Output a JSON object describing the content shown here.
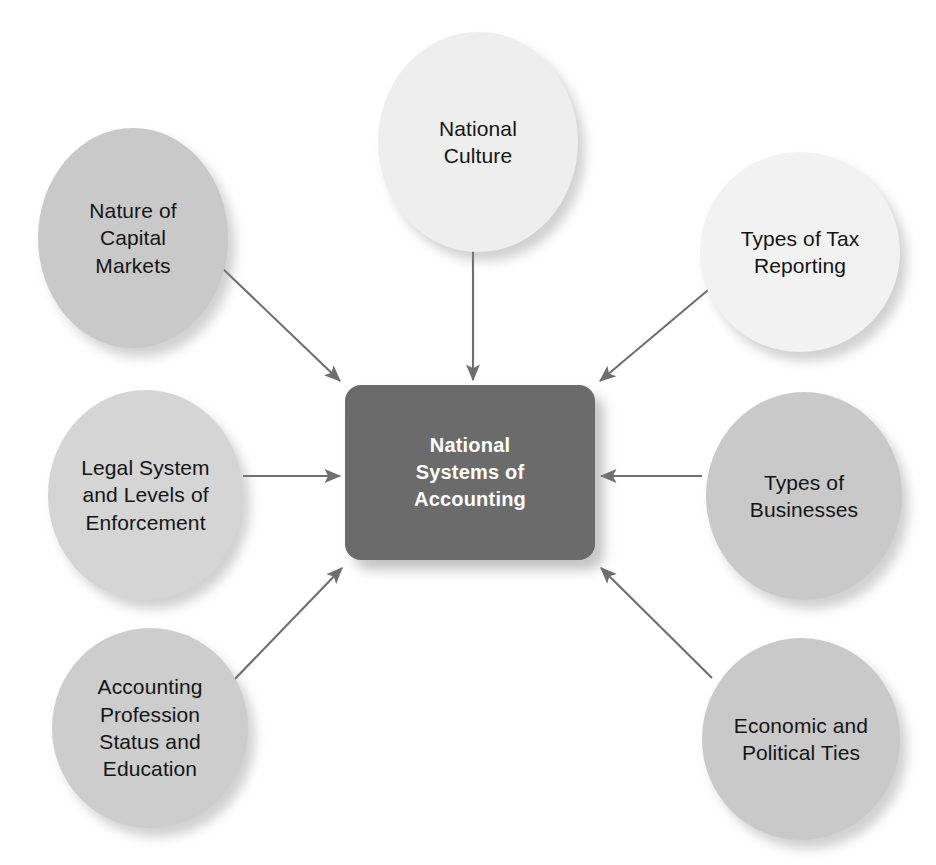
{
  "diagram": {
    "type": "hub-and-spoke",
    "title": "National Systems of Accounting",
    "background_color": "#ffffff",
    "arrow_color": "#6e6e6e",
    "center": {
      "label": "National\nSystems of\nAccounting",
      "fill_color": "#6b6b6b",
      "text_color": "#ffffff",
      "x": 345,
      "y": 385,
      "width": 250,
      "height": 175
    },
    "nodes": [
      {
        "id": "nature-of-capital-markets",
        "label": "Nature of\nCapital\nMarkets",
        "fill_color": "#c9c9c9",
        "text_color": "#141414",
        "x": 38,
        "y": 128,
        "width": 190,
        "height": 220,
        "arrow": "diagonal-down-right"
      },
      {
        "id": "national-culture",
        "label": "National\nCulture",
        "fill_color": "#eeeeee",
        "text_color": "#141414",
        "x": 378,
        "y": 32,
        "width": 200,
        "height": 220,
        "arrow": "straight-down"
      },
      {
        "id": "types-of-tax-reporting",
        "label": "Types of Tax\nReporting",
        "fill_color": "#f2f2f2",
        "text_color": "#141414",
        "x": 700,
        "y": 152,
        "width": 200,
        "height": 200,
        "arrow": "diagonal-down-left"
      },
      {
        "id": "legal-system-and-levels-of-enforcement",
        "label": "Legal System\nand Levels of\nEnforcement",
        "fill_color": "#d5d5d5",
        "text_color": "#141414",
        "x": 48,
        "y": 390,
        "width": 195,
        "height": 210,
        "arrow": "straight-right"
      },
      {
        "id": "types-of-businesses",
        "label": "Types of\nBusinesses",
        "fill_color": "#c9c9c9",
        "text_color": "#141414",
        "x": 706,
        "y": 392,
        "width": 196,
        "height": 208,
        "arrow": "straight-left"
      },
      {
        "id": "accounting-profession-status-and-education",
        "label": "Accounting\nProfession\nStatus and\nEducation",
        "fill_color": "#cdcdcd",
        "text_color": "#141414",
        "x": 52,
        "y": 628,
        "width": 196,
        "height": 200,
        "arrow": "diagonal-up-right"
      },
      {
        "id": "economic-and-political-ties",
        "label": "Economic and\nPolitical Ties",
        "fill_color": "#c9c9c9",
        "text_color": "#141414",
        "x": 702,
        "y": 638,
        "width": 198,
        "height": 202,
        "arrow": "diagonal-up-left"
      }
    ]
  }
}
